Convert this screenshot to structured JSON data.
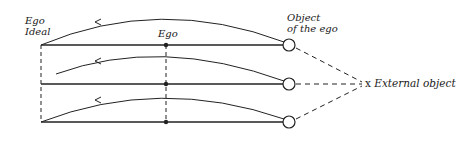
{
  "diagram": {
    "labels": {
      "ego_ideal_line1": "Ego",
      "ego_ideal_line2": "Ideal",
      "ego": "Ego",
      "object_line1": "Object",
      "object_line2": "of the ego",
      "external_marker": "x",
      "external_object": "External object"
    },
    "rows": 3,
    "colors": {
      "ink": "#222222",
      "background": "#ffffff"
    }
  }
}
